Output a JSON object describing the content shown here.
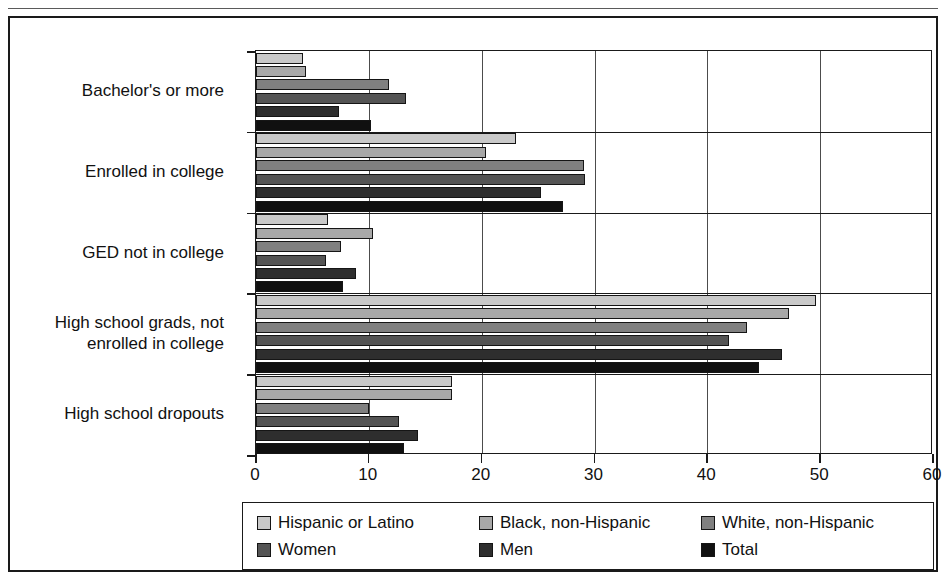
{
  "chart_data": {
    "type": "bar",
    "orientation": "horizontal",
    "title": "",
    "xlabel": "",
    "ylabel": "",
    "xlim": [
      0,
      60
    ],
    "xticks": [
      "0",
      "10",
      "20",
      "30",
      "40",
      "50",
      "60"
    ],
    "xtick_values": [
      0,
      10,
      20,
      30,
      40,
      50,
      60
    ],
    "grid": true,
    "grid_axis": "x",
    "legend_position": "bottom",
    "categories": [
      "Bachelor's or more",
      "Enrolled in college",
      "GED not in college",
      "High school grads, not enrolled in college",
      "High school dropouts"
    ],
    "series": [
      {
        "name": "Hispanic or Latino",
        "color": "#c9c9c9",
        "values": [
          4.2,
          23.0,
          6.4,
          49.6,
          17.4
        ]
      },
      {
        "name": "Black, non-Hispanic",
        "color": "#a8a8a8",
        "values": [
          4.4,
          20.4,
          10.4,
          47.2,
          17.4
        ]
      },
      {
        "name": "White, non-Hispanic",
        "color": "#808080",
        "values": [
          11.8,
          29.1,
          7.5,
          43.5,
          10.0
        ]
      },
      {
        "name": "Women",
        "color": "#545454",
        "values": [
          13.3,
          29.2,
          6.2,
          41.9,
          12.7
        ]
      },
      {
        "name": "Men",
        "color": "#2e2e2e",
        "values": [
          7.4,
          25.3,
          8.9,
          46.6,
          14.4
        ]
      },
      {
        "name": "Total",
        "color": "#101010",
        "values": [
          10.2,
          27.2,
          7.7,
          44.6,
          13.1
        ]
      }
    ]
  },
  "axis": {
    "x_tick_labels": [
      "0",
      "10",
      "20",
      "30",
      "40",
      "50",
      "60"
    ]
  },
  "legend": {
    "rows": [
      [
        "Hispanic or Latino",
        "Black, non-Hispanic",
        "White, non-Hispanic"
      ],
      [
        "Women",
        "Men",
        "Total"
      ]
    ]
  },
  "categories_display": [
    {
      "lines": [
        "Bachelor's or more"
      ]
    },
    {
      "lines": [
        "Enrolled in college"
      ]
    },
    {
      "lines": [
        "GED not in college"
      ]
    },
    {
      "lines": [
        "High school grads, not",
        "enrolled in college"
      ]
    },
    {
      "lines": [
        "High school dropouts"
      ]
    }
  ]
}
